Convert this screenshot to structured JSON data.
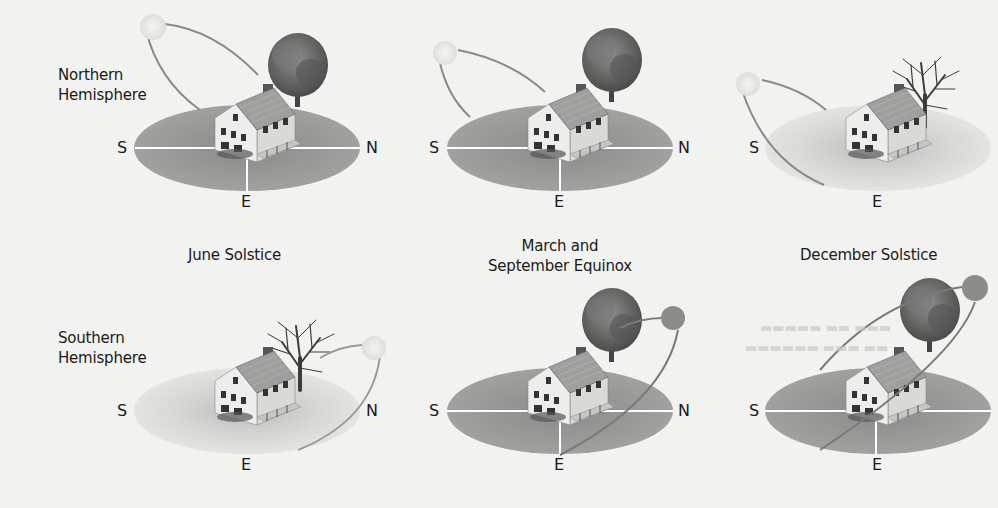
{
  "hemispheres": {
    "northern": {
      "line1": "Northern",
      "line2": "Hemisphere"
    },
    "southern": {
      "line1": "Southern",
      "line2": "Hemisphere"
    }
  },
  "seasons": {
    "june": {
      "label": "June Solstice"
    },
    "equinox": {
      "line1": "March and",
      "line2": "September Equinox"
    },
    "december": {
      "label": "December Solstice"
    }
  },
  "directions": {
    "south": "S",
    "north": "N",
    "east": "E"
  },
  "colors": {
    "background": "#f2f2f0",
    "ground_summer": "#9a9a98",
    "ground_winter": "#dcdcda",
    "sun_bright": "#8c8c8a",
    "sun_dim": "#e6e6e4",
    "sun_path": "#8a8a88",
    "axis_line": "#ffffff"
  },
  "panels": [
    {
      "row": "northern",
      "season": "june",
      "ground": "summer",
      "sun": "dim",
      "tree": "leafy"
    },
    {
      "row": "northern",
      "season": "equinox",
      "ground": "summer",
      "sun": "dim",
      "tree": "leafy"
    },
    {
      "row": "northern",
      "season": "december",
      "ground": "winter",
      "sun": "dim",
      "tree": "bare"
    },
    {
      "row": "southern",
      "season": "june",
      "ground": "winter",
      "sun": "dim",
      "tree": "bare"
    },
    {
      "row": "southern",
      "season": "equinox",
      "ground": "summer",
      "sun": "bright",
      "tree": "leafy"
    },
    {
      "row": "southern",
      "season": "december",
      "ground": "summer",
      "sun": "bright",
      "tree": "leafy"
    }
  ]
}
